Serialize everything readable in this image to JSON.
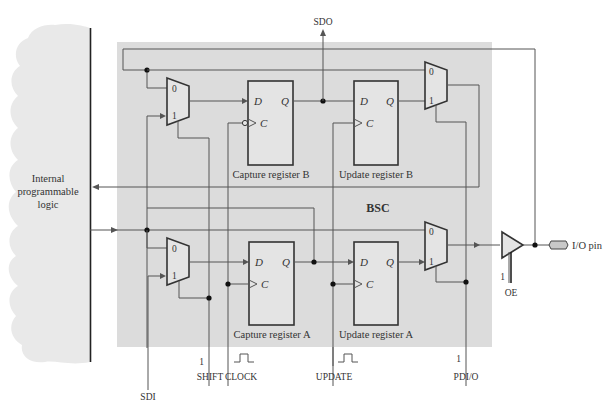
{
  "diagram": {
    "bsc_label": "BSC",
    "internal_logic": {
      "line1": "Internal",
      "line2": "programmable",
      "line3": "logic"
    },
    "signals": {
      "sdo": "SDO",
      "sdi": "SDI",
      "shift": "SHIFT",
      "shift_value": "1",
      "clock": "CLOCK",
      "update": "UPDATE",
      "pdio": "PDI/O",
      "pdio_value": "1",
      "oe": "OE",
      "oe_value": "1",
      "io_pin": "I/O pin"
    },
    "registers": {
      "capture_b": "Capture register B",
      "update_b": "Update register B",
      "capture_a": "Capture register A",
      "update_a": "Update register A"
    },
    "ports": {
      "d": "D",
      "q": "Q",
      "c": "C",
      "mux_in0": "0",
      "mux_in1": "1"
    },
    "colors": {
      "bsc_fill": "#dcdcdc",
      "cloud_fill": "#e8e8e8",
      "wire": "#555555"
    }
  }
}
